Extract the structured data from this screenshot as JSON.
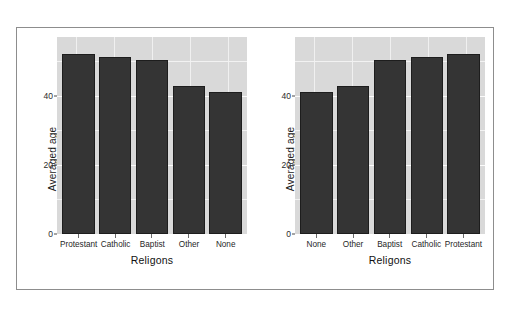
{
  "figure": {
    "background_color": "#ffffff",
    "frame_border_color": "#8d8d8d",
    "panel_background_color": "#d9d9d9",
    "bar_color": "#343434",
    "gridline_color": "#ffffff"
  },
  "chart_data": [
    {
      "type": "bar",
      "title": "",
      "xlabel": "Religons",
      "ylabel": "Averaged age",
      "categories": [
        "Protestant",
        "Catholic",
        "Baptist",
        "Other",
        "None"
      ],
      "values": [
        52.0,
        51.3,
        50.3,
        42.9,
        41.2
      ],
      "ylim": [
        0,
        57
      ],
      "yticks": [
        0,
        20,
        40
      ],
      "ytick_labels": [
        "0",
        "20",
        "40"
      ],
      "grid": true,
      "legend": "none",
      "panel": "left"
    },
    {
      "type": "bar",
      "title": "",
      "xlabel": "Religons",
      "ylabel": "Averaged age",
      "categories": [
        "None",
        "Other",
        "Baptist",
        "Catholic",
        "Protestant"
      ],
      "values": [
        41.2,
        42.9,
        50.3,
        51.3,
        52.0
      ],
      "ylim": [
        0,
        57
      ],
      "yticks": [
        0,
        20,
        40
      ],
      "ytick_labels": [
        "0",
        "20",
        "40"
      ],
      "grid": true,
      "legend": "none",
      "panel": "right"
    }
  ]
}
